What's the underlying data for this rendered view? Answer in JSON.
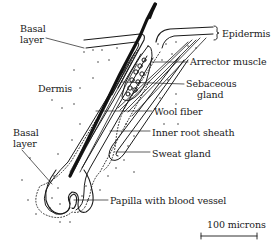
{
  "figure": {
    "labels": {
      "basal_layer_top": [
        "Basal",
        "layer"
      ],
      "epidermis": "Epidermis",
      "arrector_muscle": "Arrector muscle",
      "sebaceous_gland": [
        "Sebaceous",
        "gland"
      ],
      "dermis": "Dermis",
      "wool_fiber": "Wool fiber",
      "inner_root_sheath": "Inner root sheath",
      "basal_layer_bottom": [
        "Basal",
        "layer"
      ],
      "sweat_gland": "Sweat gland",
      "papilla": "Papilla with blood vessel"
    },
    "scale_bar": {
      "label": "100 microns",
      "value": 100,
      "unit": "microns"
    },
    "colors": {
      "ink": "#1a1a1a",
      "background": "#ffffff"
    }
  }
}
